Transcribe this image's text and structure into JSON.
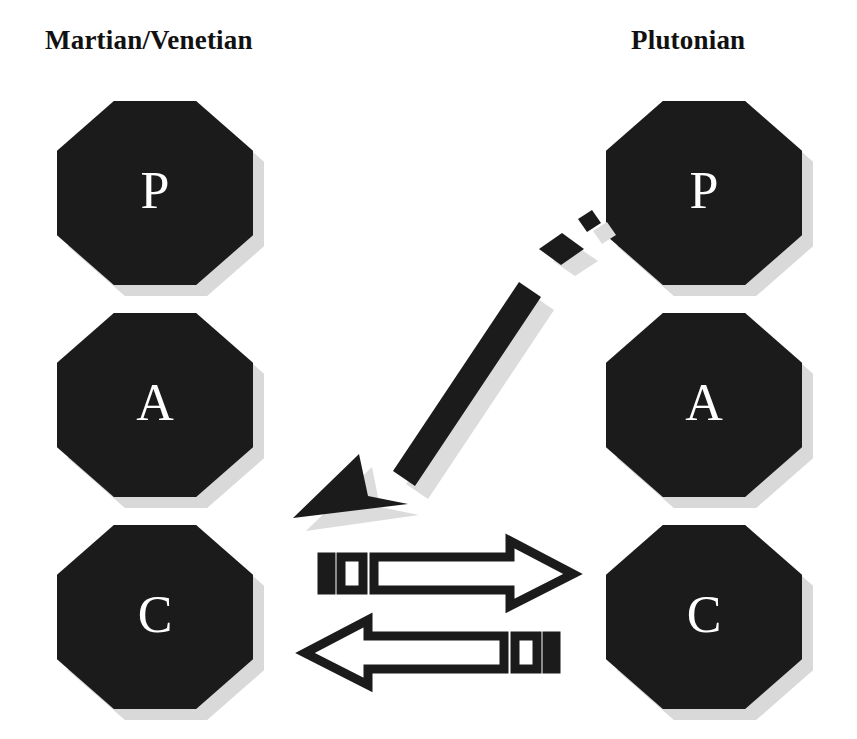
{
  "diagram": {
    "background_color": "#ffffff"
  },
  "columns": [
    {
      "id": "left",
      "heading": "Martian/Venetian"
    },
    {
      "id": "right",
      "heading": "Plutonian"
    }
  ],
  "nodes": {
    "left": [
      {
        "id": "left-p",
        "label": "P"
      },
      {
        "id": "left-a",
        "label": "A"
      },
      {
        "id": "left-c",
        "label": "C"
      }
    ],
    "right": [
      {
        "id": "right-p",
        "label": "P"
      },
      {
        "id": "right-a",
        "label": "A"
      },
      {
        "id": "right-c",
        "label": "C"
      }
    ]
  },
  "arrows": [
    {
      "id": "diagonal-arrow",
      "style": "solid-filled",
      "direction": "down-left",
      "from": "right-p",
      "to": "left-c",
      "segments": 3,
      "has_shadow": true
    },
    {
      "id": "arrow-right",
      "style": "outline-block",
      "direction": "right",
      "from": "left-c",
      "to": "right-c",
      "segments": 2,
      "has_shadow": false
    },
    {
      "id": "arrow-left",
      "style": "outline-block",
      "direction": "left",
      "from": "right-c",
      "to": "left-c",
      "segments": 2,
      "has_shadow": false
    }
  ],
  "colors": {
    "node_fill": "#1b1b1b",
    "node_label": "#ffffff",
    "node_shadow": "#d9d9d9",
    "stroke": "#1b1b1b",
    "heading": "#111111",
    "arrow_shadow": "#dcdcdc"
  }
}
